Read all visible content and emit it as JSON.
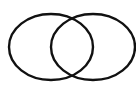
{
  "diagram": {
    "type": "venn",
    "sets": [
      {
        "id": "left",
        "label": "",
        "cx": 51,
        "cy": 47,
        "rx": 42,
        "ry": 33
      },
      {
        "id": "right",
        "label": "",
        "cx": 93,
        "cy": 47,
        "rx": 42,
        "ry": 33
      }
    ],
    "stroke_color": "#111111",
    "fill_color": "none",
    "stroke_width": 2.4
  }
}
